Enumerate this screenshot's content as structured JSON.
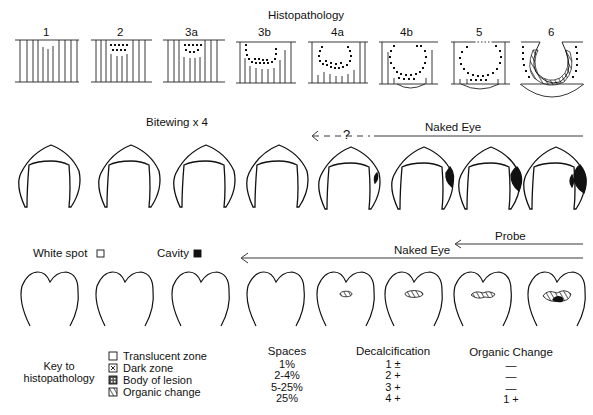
{
  "histopathology": {
    "title": "Histopathology",
    "stages": [
      "1",
      "2",
      "3a",
      "3b",
      "4a",
      "4b",
      "5",
      "6"
    ]
  },
  "bitewing": {
    "title": "Bitewing x 4",
    "naked_eye_label": "Naked Eye",
    "uncertain_label": "?"
  },
  "clinical": {
    "white_spot_label": "White spot",
    "cavity_label": "Cavity",
    "probe_label": "Probe",
    "naked_eye_label": "Naked Eye"
  },
  "key": {
    "title_line1": "Key to",
    "title_line2": "histopathology",
    "items": [
      {
        "label": "Translucent zone",
        "swatch": "empty"
      },
      {
        "label": "Dark zone",
        "swatch": "x"
      },
      {
        "label": "Body of lesion",
        "swatch": "dotted"
      },
      {
        "label": "Organic change",
        "swatch": "hatched"
      }
    ]
  },
  "table": {
    "spaces": {
      "header": "Spaces",
      "values": [
        "1%",
        "2-4%",
        "5-25%",
        "25%"
      ]
    },
    "decalcification": {
      "header": "Decalcification",
      "values": [
        "1 ±",
        "2 +",
        "3 +",
        "4 +"
      ]
    },
    "organic_change": {
      "header": "Organic Change",
      "values": [
        "—",
        "—",
        "—",
        "1 +"
      ]
    }
  }
}
